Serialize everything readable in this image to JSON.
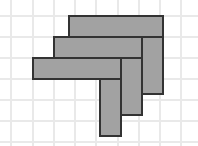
{
  "figure": {
    "canvas": {
      "width": 198,
      "height": 146,
      "background": "#ffffff"
    },
    "grid": {
      "visible": true,
      "cell_size": 21,
      "origin_x": 11,
      "origin_y": 16,
      "line_color": "#e9e9e9",
      "x_lines": [
        11,
        33,
        54,
        75,
        96,
        118,
        139,
        160,
        181
      ],
      "y_lines": [
        16,
        37,
        58,
        79,
        100,
        121,
        142
      ]
    },
    "style": {
      "fill_color": "#a2a2a2",
      "stroke_color": "#333333",
      "stroke_width": 2
    },
    "pieces": [
      {
        "name": "back-step-piece",
        "label": "Top L-shaped piece",
        "outline": "69,16 163,16 163,94 142,94 142,37 69,37",
        "cell_count": 7
      },
      {
        "name": "middle-step-piece",
        "label": "Middle L-shaped piece",
        "outline": "54,37 142,37 142,115 121,115 121,58 54,58",
        "cell_count": 7
      },
      {
        "name": "front-step-piece",
        "label": "Bottom L-shaped piece",
        "outline": "33,58 121,58 121,136 100,136 100,79 33,79",
        "cell_count": 7
      }
    ],
    "seams": [
      {
        "name": "seam-top-bar-row",
        "x1": 142,
        "y1": 37,
        "x2": 163,
        "y2": 37
      },
      {
        "name": "seam-middle-bar-row",
        "x1": 121,
        "y1": 58,
        "x2": 142,
        "y2": 58
      },
      {
        "name": "seam-front-bar-row",
        "x1": 100,
        "y1": 79,
        "x2": 121,
        "y2": 79
      }
    ]
  }
}
